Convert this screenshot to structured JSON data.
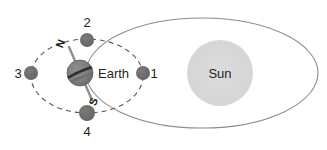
{
  "diagram": {
    "type": "astronomy-orbital-diagram",
    "background_color": "#ffffff"
  },
  "sun": {
    "label": "Sun",
    "fill_color": "#d8d8d8",
    "cx": 220,
    "cy": 73,
    "r": 33,
    "label_color": "#231f20"
  },
  "earth": {
    "label": "Earth",
    "fill_color": "#808080",
    "stroke_color": "#58585a",
    "cx": 80,
    "cy": 73,
    "r": 13,
    "label_x": 98,
    "label_y": 78,
    "axis": {
      "north_label": "N",
      "south_label": "S",
      "line_color": "#808080",
      "tilt_note": "axis tilted, N toward upper-left, S toward lower-right"
    }
  },
  "earth_orbit": {
    "name": "earth-orbit-ellipse",
    "style": "solid",
    "stroke_color": "#8c8c8c",
    "cx": 202,
    "cy": 73,
    "rx": 116,
    "ry": 55
  },
  "moon_orbit": {
    "name": "moon-orbit-ellipse",
    "style": "dashed",
    "stroke_color": "#58585a",
    "cx": 87,
    "cy": 76,
    "rx": 56,
    "ry": 37
  },
  "moon_positions": [
    {
      "label": "1",
      "cx": 143,
      "cy": 73,
      "r": 7,
      "label_x": 154,
      "label_y": 78,
      "label_side": "right",
      "fill_color": "#6e6e6e"
    },
    {
      "label": "2",
      "cx": 87,
      "cy": 40,
      "r": 7,
      "label_x": 87,
      "label_y": 27,
      "label_side": "above",
      "fill_color": "#6e6e6e"
    },
    {
      "label": "3",
      "cx": 31,
      "cy": 73,
      "r": 7,
      "label_x": 18,
      "label_y": 78,
      "label_side": "left",
      "fill_color": "#6e6e6e"
    },
    {
      "label": "4",
      "cx": 87,
      "cy": 113,
      "r": 8,
      "label_x": 87,
      "label_y": 136,
      "label_side": "below",
      "fill_color": "#6e6e6e"
    }
  ]
}
